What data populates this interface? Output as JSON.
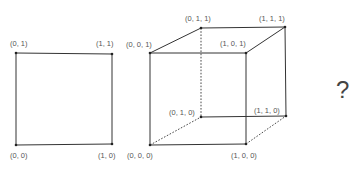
{
  "figures": [
    {
      "id": "square",
      "name": "unit-square",
      "vertices": [
        {
          "label": "(0, 1)",
          "x": 16,
          "y": 53,
          "lx": 10,
          "ly": 46
        },
        {
          "label": "(1, 1)",
          "x": 112,
          "y": 54,
          "lx": 96,
          "ly": 46
        },
        {
          "label": "(0, 0)",
          "x": 16,
          "y": 145,
          "lx": 10,
          "ly": 158
        },
        {
          "label": "(1, 0)",
          "x": 112,
          "y": 144,
          "lx": 98,
          "ly": 158
        }
      ],
      "edges": [
        {
          "from": 0,
          "to": 1,
          "dashed": false
        },
        {
          "from": 1,
          "to": 3,
          "dashed": false
        },
        {
          "from": 3,
          "to": 2,
          "dashed": false
        },
        {
          "from": 2,
          "to": 0,
          "dashed": false
        }
      ]
    },
    {
      "id": "cube",
      "name": "unit-cube",
      "vertices": [
        {
          "label": "(0, 0, 1)",
          "x": 150,
          "y": 53,
          "lx": 126,
          "ly": 47
        },
        {
          "label": "(0, 1, 1)",
          "x": 201,
          "y": 28,
          "lx": 185,
          "ly": 21
        },
        {
          "label": "(1, 1, 1)",
          "x": 285,
          "y": 27,
          "lx": 259,
          "ly": 21
        },
        {
          "label": "(1, 0, 1)",
          "x": 246,
          "y": 53,
          "lx": 220,
          "ly": 46
        },
        {
          "label": "(0, 0, 0)",
          "x": 150,
          "y": 145,
          "lx": 127,
          "ly": 158
        },
        {
          "label": "(0, 1, 0)",
          "x": 201,
          "y": 117,
          "lx": 169,
          "ly": 115
        },
        {
          "label": "(1, 1, 0)",
          "x": 286,
          "y": 116,
          "lx": 254,
          "ly": 113
        },
        {
          "label": "(1, 0, 0)",
          "x": 246,
          "y": 144,
          "lx": 231,
          "ly": 158
        }
      ],
      "edges": [
        {
          "from": 0,
          "to": 1,
          "dashed": false
        },
        {
          "from": 1,
          "to": 2,
          "dashed": false
        },
        {
          "from": 2,
          "to": 3,
          "dashed": false
        },
        {
          "from": 3,
          "to": 0,
          "dashed": false
        },
        {
          "from": 0,
          "to": 4,
          "dashed": false
        },
        {
          "from": 3,
          "to": 7,
          "dashed": false
        },
        {
          "from": 2,
          "to": 6,
          "dashed": false
        },
        {
          "from": 4,
          "to": 7,
          "dashed": false
        },
        {
          "from": 5,
          "to": 6,
          "dashed": false
        },
        {
          "from": 1,
          "to": 5,
          "dashed": true
        },
        {
          "from": 4,
          "to": 5,
          "dashed": true
        },
        {
          "from": 7,
          "to": 6,
          "dashed": true
        }
      ]
    }
  ],
  "question": {
    "text": "?",
    "x": 336,
    "y": 98
  }
}
